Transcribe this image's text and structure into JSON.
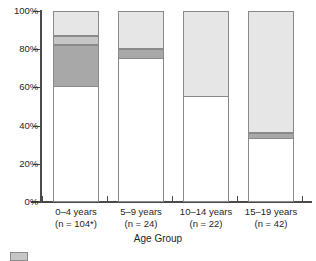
{
  "chart_data": {
    "type": "bar",
    "subtype": "stacked-100-percent",
    "title": "",
    "xlabel": "Age Group",
    "ylabel": "",
    "ylim": [
      0,
      100
    ],
    "ytick_labels": [
      "100%",
      "80%",
      "60%",
      "40%",
      "20%",
      "0%"
    ],
    "ytick_values": [
      100,
      80,
      60,
      40,
      20,
      0
    ],
    "grid": false,
    "legend_position": "bottom-left",
    "categories": [
      "0–4 years",
      "5–9 years",
      "10–14 years",
      "15–19 years"
    ],
    "category_notes": [
      "(n = 104*)",
      "(n = 24)",
      "(n = 22)",
      "(n = 42)"
    ],
    "series": [
      {
        "name": "segment-1-white",
        "color": "#ffffff",
        "values": [
          60,
          75,
          55,
          33
        ]
      },
      {
        "name": "segment-2-dark-gray",
        "color": "#a8a8a8",
        "values": [
          22,
          5,
          0,
          3
        ]
      },
      {
        "name": "segment-3-medium-gray",
        "color": "#c6c6c6",
        "values": [
          5,
          0,
          0,
          0
        ]
      },
      {
        "name": "segment-4-light-gray",
        "color": "#e6e6e6",
        "values": [
          13,
          20,
          45,
          64
        ]
      }
    ]
  },
  "axis": {
    "x_title": "Age Group"
  },
  "legend": {
    "items": [
      {
        "label": "",
        "color": "#c6c6c6"
      }
    ]
  },
  "colors": {
    "axis": "#4a4a4a",
    "bar_outline": "#8a8a8a",
    "text": "#1f1f1f",
    "background": "#ffffff"
  }
}
